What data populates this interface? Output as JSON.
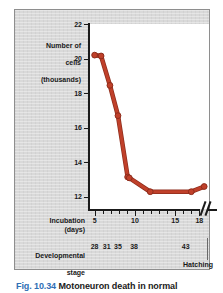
{
  "figure": {
    "caption_number": "Fig. 10.34",
    "caption_text": "Motoneuron death in normal"
  },
  "axes": {
    "y_title": "Number of\ncells\n(thousands)",
    "y_title_lines": [
      "Number of",
      "cells",
      "(thousands)"
    ],
    "x_title": "Incubation (days)",
    "stage_title": "Developmental\nstage",
    "stage_title_lines": [
      "Developmental",
      "stage"
    ],
    "hatching_label": "Hatching",
    "axis_break_symbol": "//"
  },
  "chart_data": {
    "type": "line",
    "title": "",
    "xlabel": "Incubation (days)",
    "ylabel": "Number of cells (thousands)",
    "xlim": [
      4.3,
      19.2
    ],
    "ylim": [
      11.3,
      22
    ],
    "grid": false,
    "legend": null,
    "y_ticks": [
      22,
      20,
      18,
      16,
      14,
      12
    ],
    "y_tick_labels": [
      "22",
      "20",
      "18",
      "16",
      "14",
      "12"
    ],
    "x_ticks": [
      5,
      6,
      7,
      8,
      9,
      10,
      11,
      12,
      13,
      14,
      15,
      16,
      17,
      18
    ],
    "x_tick_labels_major": [
      {
        "x": 5,
        "label": "5"
      },
      {
        "x": 10,
        "label": "10"
      },
      {
        "x": 15,
        "label": "15"
      },
      {
        "x": 18,
        "label": "18"
      }
    ],
    "secondary_axis": {
      "name": "Developmental stage",
      "ticks": [
        {
          "x": 5,
          "label": "28"
        },
        {
          "x": 6.5,
          "label": "31"
        },
        {
          "x": 7.9,
          "label": "35"
        },
        {
          "x": 9.9,
          "label": "38"
        },
        {
          "x": 16.3,
          "label": "43"
        }
      ],
      "end_marker": "Hatching"
    },
    "series": [
      {
        "name": "Motoneuron number",
        "color": "#c0402a",
        "marker": "circle",
        "x": [
          5.0,
          5.8,
          6.9,
          7.9,
          9.1,
          9.3,
          11.9,
          17.0,
          18.6
        ],
        "y": [
          20.2,
          20.15,
          18.45,
          16.7,
          13.15,
          13.1,
          12.3,
          12.3,
          12.6
        ]
      }
    ]
  },
  "colors": {
    "series": "#c0402a",
    "series_dark": "#8e2d1c",
    "panel_background": "#d9d9d9",
    "plot_background": "#ffffff",
    "axis": "#1a1a1a",
    "caption_number": "#2f6fb5"
  }
}
